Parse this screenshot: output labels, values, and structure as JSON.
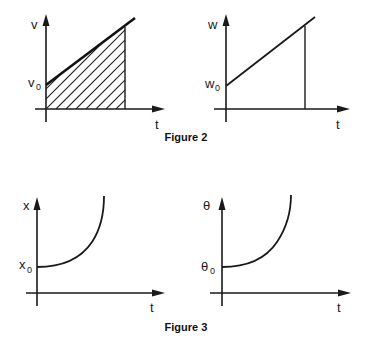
{
  "figure2": {
    "caption": "Figure 2",
    "plot_v": {
      "y_label": "v",
      "y0_label_main": "v",
      "y0_label_sub": "0",
      "x_label": "t",
      "shaded": true
    },
    "plot_w": {
      "y_label": "w",
      "y0_label_main": "w",
      "y0_label_sub": "0",
      "x_label": "t",
      "shaded": false
    }
  },
  "figure3": {
    "caption": "Figure 3",
    "plot_x": {
      "y_label": "x",
      "y0_label_main": "x",
      "y0_label_sub": "0",
      "x_label": "t"
    },
    "plot_theta": {
      "y_label": "θ",
      "y0_label_main": "θ",
      "y0_label_sub": "0",
      "x_label": "t"
    }
  },
  "colors": {
    "ink": "#1a1a1a",
    "background": "#ffffff"
  }
}
